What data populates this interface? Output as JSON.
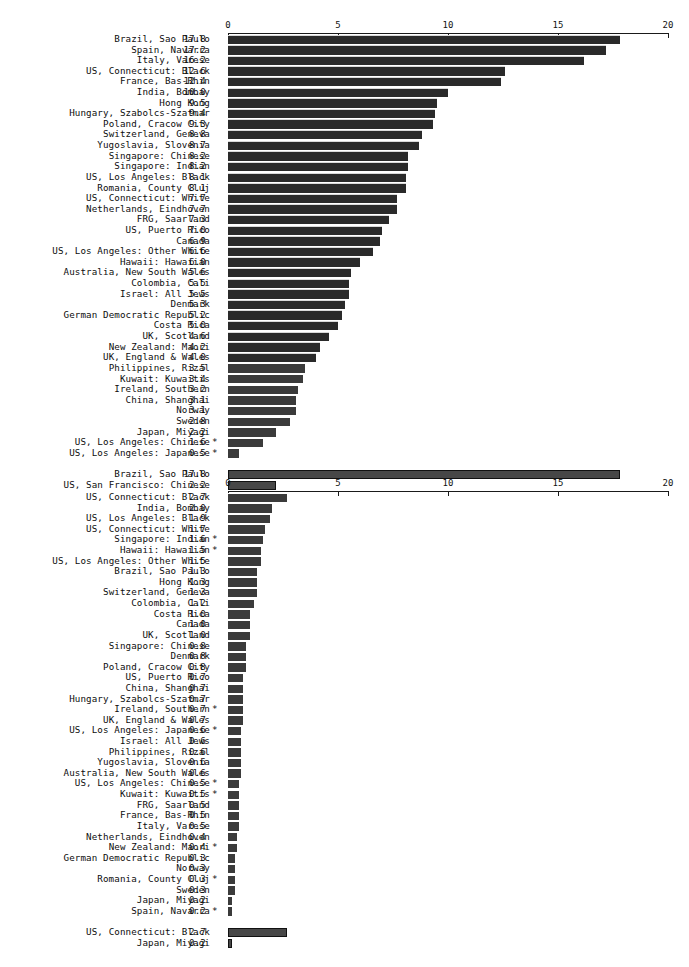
{
  "figure": {
    "background": "#ffffff",
    "bar_color": "#3b3b3b",
    "axis_color": "#1a1a1a",
    "text_color": "#0d0d0d"
  },
  "chart_data": [
    {
      "type": "bar",
      "orientation": "horizontal",
      "title": "",
      "xlabel": "",
      "ylabel": "",
      "xlim": [
        0,
        20
      ],
      "xticks": [
        0,
        5,
        10,
        15,
        20
      ],
      "xtick_labels": [
        "0",
        "5",
        "10",
        "15",
        "20"
      ],
      "grid": false,
      "legend": null,
      "categories": [
        "Brazil, Sao Paulo",
        "Spain, Navarra",
        "Italy, Varese",
        "US, Connecticut: Black",
        "France, Bas-Rhin",
        "India, Bombay",
        "Hong Kong",
        "Hungary, Szabolcs-Szatmar",
        "Poland, Cracow City",
        "Switzerland, Geneva",
        "Yugoslavia, Slovenia",
        "Singapore: Chinese",
        "Singapore: Indian",
        "US, Los Angeles: Black",
        "Romania, County Cluj",
        "US, Connecticut: White",
        "Netherlands, Eindhoven",
        "FRG, Saarland",
        "US, Puerto Rico",
        "Canada",
        "US, Los Angeles: Other White",
        "Hawaii: Hawaiian",
        "Australia, New South Wales",
        "Colombia, Cali",
        "Israel: All Jews",
        "Denmark",
        "German Democratic Republic",
        "Costa Rica",
        "UK, Scotland",
        "New Zealand: Maori",
        "UK, England & Wales",
        "Philippines, Rizal",
        "Kuwait: Kuwaitis",
        "Ireland, Southern",
        "China, Shanghai",
        "Norway",
        "Sweden",
        "Japan, Miyagi",
        "US, Los Angeles: Chinese",
        "US, Los Angeles: Japanese"
      ],
      "values": [
        17.8,
        17.2,
        16.2,
        12.6,
        12.4,
        10.0,
        9.5,
        9.4,
        9.3,
        8.8,
        8.7,
        8.2,
        8.2,
        8.1,
        8.1,
        7.7,
        7.7,
        7.3,
        7.0,
        6.9,
        6.6,
        6.0,
        5.6,
        5.5,
        5.5,
        5.3,
        5.2,
        5.0,
        4.6,
        4.2,
        4.0,
        3.5,
        3.4,
        3.2,
        3.1,
        3.1,
        2.8,
        2.2,
        1.6,
        0.5
      ],
      "value_labels": [
        "17.8",
        "17.2",
        "16.2",
        "12.6",
        "12.4",
        "10.0",
        "9.5",
        "9.4",
        "9.3",
        "8.8",
        "8.7",
        "8.2",
        "8.2",
        "8.1",
        "8.1",
        "7.7",
        "7.7",
        "7.3",
        "7.0",
        "6.9",
        "6.6",
        "6.0",
        "5.6",
        "5.5",
        "5.5",
        "5.3",
        "5.2",
        "5.0",
        "4.6",
        "4.2",
        "4.0",
        "3.5",
        "3.4",
        "3.2",
        "3.1",
        "3.1",
        "2.8",
        "2.2",
        "1.6",
        "0.5"
      ],
      "flags": [
        "",
        "",
        "",
        "",
        "",
        "",
        "",
        "",
        "",
        "",
        "",
        "",
        "",
        "",
        "",
        "",
        "",
        "",
        "",
        "",
        "",
        "",
        "",
        "",
        "",
        "",
        "",
        "",
        "",
        "",
        "",
        "",
        "",
        "",
        "",
        "",
        "",
        "",
        "*",
        "*"
      ],
      "extra_group": {
        "categories": [
          "Brazil, Sao Paulo",
          "US, San Francisco: Chinese"
        ],
        "values": [
          17.8,
          2.2
        ],
        "value_labels": [
          "17.8",
          "2.2"
        ],
        "flags": [
          "",
          ""
        ]
      }
    },
    {
      "type": "bar",
      "orientation": "horizontal",
      "title": "",
      "xlabel": "",
      "ylabel": "",
      "xlim": [
        0,
        20
      ],
      "xticks": [
        0,
        5,
        10,
        15,
        20
      ],
      "xtick_labels": [
        "0",
        "5",
        "10",
        "15",
        "20"
      ],
      "grid": false,
      "legend": null,
      "categories": [
        "US, Connecticut: Black",
        "India, Bombay",
        "US, Los Angeles: Black",
        "US, Connecticut: White",
        "Singapore: Indian",
        "Hawaii: Hawaiian",
        "US, Los Angeles: Other White",
        "Brazil, Sao Paulo",
        "Hong Kong",
        "Switzerland, Geneva",
        "Colombia, Cali",
        "Costa Rica",
        "Canada",
        "UK, Scotland",
        "Singapore: Chinese",
        "Denmark",
        "Poland, Cracow City",
        "US, Puerto Rico",
        "China, Shanghai",
        "Hungary, Szabolcs-Szatmar",
        "Ireland, Southern",
        "UK, England & Wales",
        "US, Los Angeles: Japanese",
        "Israel: All Jews",
        "Philippines, Rizal",
        "Yugoslavia, Slovenia",
        "Australia, New South Wales",
        "US, Los Angeles: Chinese",
        "Kuwait: Kuwaitis",
        "FRG, Saarland",
        "France, Bas-Rhin",
        "Italy, Varese",
        "Netherlands, Eindhoven",
        "New Zealand: Maori",
        "German Democratic Republic",
        "Norway",
        "Romania, County Cluj",
        "Sweden",
        "Japan, Miyagi",
        "Spain, Navarra"
      ],
      "values": [
        2.7,
        2.0,
        1.9,
        1.7,
        1.6,
        1.5,
        1.5,
        1.3,
        1.3,
        1.3,
        1.2,
        1.0,
        1.0,
        1.0,
        0.8,
        0.8,
        0.8,
        0.7,
        0.7,
        0.7,
        0.7,
        0.7,
        0.6,
        0.6,
        0.6,
        0.6,
        0.6,
        0.5,
        0.5,
        0.5,
        0.5,
        0.5,
        0.4,
        0.4,
        0.3,
        0.3,
        0.3,
        0.3,
        0.2,
        0.2
      ],
      "value_labels": [
        "2.7",
        "2.0",
        "1.9",
        "1.7",
        "1.6",
        "1.5",
        "1.5",
        "1.3",
        "1.3",
        "1.3",
        "1.2",
        "1.0",
        "1.0",
        "1.0",
        "0.8",
        "0.8",
        "0.8",
        "0.7",
        "0.7",
        "0.7",
        "0.7",
        "0.7",
        "0.6",
        "0.6",
        "0.6",
        "0.6",
        "0.6",
        "0.5",
        "0.5",
        "0.5",
        "0.5",
        "0.5",
        "0.4",
        "0.4",
        "0.3",
        "0.3",
        "0.3",
        "0.3",
        "0.2",
        "0.2"
      ],
      "flags": [
        "",
        "",
        "",
        "",
        "*",
        "*",
        "",
        "",
        "",
        "",
        "",
        "",
        "",
        "",
        "",
        "",
        "",
        "",
        "",
        "",
        "*",
        "",
        "*",
        "",
        "",
        "",
        "",
        "*",
        "*",
        "",
        "",
        "",
        "",
        "*",
        "",
        "",
        "*",
        "",
        "",
        "*"
      ],
      "extra_group": {
        "categories": [
          "US, Connecticut: Black",
          "Japan, Miyagi"
        ],
        "values": [
          2.7,
          0.2
        ],
        "value_labels": [
          "2.7",
          "0.2"
        ],
        "flags": [
          "",
          ""
        ]
      }
    }
  ]
}
